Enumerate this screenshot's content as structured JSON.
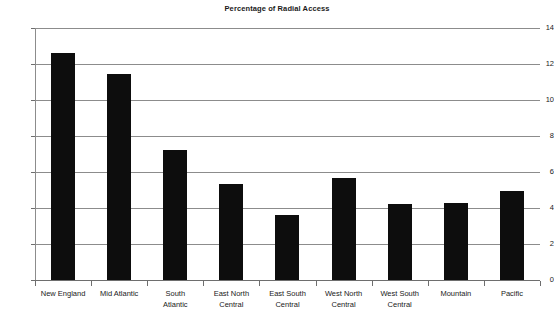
{
  "chart_data": {
    "type": "bar",
    "title": "Percentage of Radial Access",
    "xlabel": "",
    "ylabel": "",
    "ylim": [
      0,
      14
    ],
    "ytick_step": 2,
    "yticks": [
      "0",
      "2",
      "4",
      "6",
      "8",
      "10",
      "12",
      "14"
    ],
    "grid": true,
    "legend": "none",
    "bar_color": "#0d0d0d",
    "gridline_color": "#8c8c8c",
    "categories": [
      "New England",
      "Mid Atlantic",
      "South\nAtlantic",
      "East North\nCentral",
      "East South\nCentral",
      "West North\nCentral",
      "West South\nCentral",
      "Mountain",
      "Pacific"
    ],
    "values": [
      12.6,
      11.45,
      7.25,
      5.35,
      3.6,
      5.65,
      4.2,
      4.3,
      4.95
    ]
  }
}
